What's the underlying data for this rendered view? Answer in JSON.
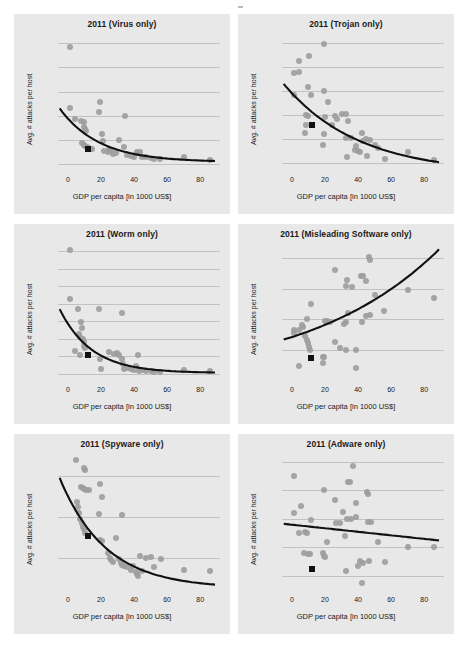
{
  "figure": {
    "title": "",
    "panel_background": "#e8e8e8",
    "point_color": "#9d9d9d",
    "highlight_color": "#111111",
    "curve_color": "#111111",
    "grid_color": "#c2c2c2"
  },
  "common": {
    "xlabel": "GDP per capita [in 1000 US$]",
    "ylabel": "Avg. # attacks per host",
    "xticks": [
      0,
      20,
      40,
      60,
      80
    ],
    "xlim": [
      -6,
      92
    ]
  },
  "chart_data": [
    {
      "type": "scatter",
      "title": "2011 (Virus only)",
      "xlabel": "GDP per capita [in 1000 US$]",
      "ylabel": "Avg. # attacks per host",
      "xlim": [
        -6,
        92
      ],
      "ylim": [
        -0.25,
        5.3
      ],
      "xticks": [
        0,
        20,
        40,
        60,
        80
      ],
      "yticks": [
        0,
        1,
        2,
        3,
        4,
        5
      ],
      "grid": true,
      "legend": "none",
      "points": [
        [
          1.5,
          4.85
        ],
        [
          1.0,
          2.3
        ],
        [
          4.5,
          1.85
        ],
        [
          8.0,
          1.8
        ],
        [
          9.5,
          1.75
        ],
        [
          10.0,
          1.55
        ],
        [
          10.5,
          1.45
        ],
        [
          11.0,
          1.35
        ],
        [
          8.5,
          0.85
        ],
        [
          9.5,
          0.8
        ],
        [
          10.5,
          0.75
        ],
        [
          11.5,
          0.72
        ],
        [
          12.5,
          0.68
        ],
        [
          13.5,
          0.62
        ],
        [
          14.5,
          0.6
        ],
        [
          19.5,
          2.55
        ],
        [
          19.0,
          2.15
        ],
        [
          20.5,
          1.25
        ],
        [
          21.0,
          0.95
        ],
        [
          22.0,
          0.55
        ],
        [
          24.0,
          0.5
        ],
        [
          25.0,
          0.62
        ],
        [
          26.0,
          0.58
        ],
        [
          27.0,
          0.42
        ],
        [
          29.0,
          0.45
        ],
        [
          31.0,
          0.98
        ],
        [
          34.5,
          2.0
        ],
        [
          34.0,
          0.72
        ],
        [
          36.0,
          0.38
        ],
        [
          38.0,
          0.35
        ],
        [
          40.0,
          0.3
        ],
        [
          42.0,
          0.48
        ],
        [
          43.5,
          0.5
        ],
        [
          45.0,
          0.28
        ],
        [
          47.0,
          0.3
        ],
        [
          50.0,
          0.25
        ],
        [
          52.0,
          0.22
        ],
        [
          56.0,
          0.2
        ],
        [
          70.5,
          0.3
        ],
        [
          86.0,
          0.18
        ]
      ],
      "highlight_point": [
        12.0,
        0.6
      ],
      "fit_type": "exponential_decay",
      "fit": {
        "y0": 2.3,
        "yinf": 0.08,
        "k": 0.042
      }
    },
    {
      "type": "scatter",
      "title": "2011 (Trojan only)",
      "xlabel": "GDP per capita [in 1000 US$]",
      "ylabel": "Avg. # attacks per host",
      "xlim": [
        -6,
        92
      ],
      "ylim": [
        0.7,
        6.3
      ],
      "xticks": [
        0,
        20,
        40,
        60,
        80
      ],
      "yticks": [
        1,
        2,
        3,
        4,
        5,
        6
      ],
      "grid": true,
      "legend": "none",
      "points": [
        [
          19.5,
          5.95
        ],
        [
          10.5,
          5.45
        ],
        [
          4.5,
          5.25
        ],
        [
          4.5,
          4.8
        ],
        [
          1.5,
          4.75
        ],
        [
          1.5,
          3.85
        ],
        [
          9.5,
          4.15
        ],
        [
          19.5,
          4.0
        ],
        [
          11.5,
          3.85
        ],
        [
          22.0,
          3.55
        ],
        [
          8.5,
          3.0
        ],
        [
          9.5,
          2.95
        ],
        [
          8.5,
          2.6
        ],
        [
          8.0,
          2.25
        ],
        [
          20.0,
          2.9
        ],
        [
          24.0,
          2.6
        ],
        [
          26.0,
          2.95
        ],
        [
          27.0,
          2.85
        ],
        [
          30.0,
          3.05
        ],
        [
          32.5,
          3.05
        ],
        [
          34.0,
          2.75
        ],
        [
          19.5,
          2.2
        ],
        [
          19.0,
          1.75
        ],
        [
          33.0,
          2.05
        ],
        [
          33.5,
          1.25
        ],
        [
          36.0,
          2.05
        ],
        [
          38.0,
          1.55
        ],
        [
          39.0,
          1.7
        ],
        [
          40.0,
          1.5
        ],
        [
          41.0,
          1.45
        ],
        [
          42.5,
          2.25
        ],
        [
          43.0,
          1.9
        ],
        [
          45.0,
          2.0
        ],
        [
          45.5,
          1.3
        ],
        [
          47.0,
          1.95
        ],
        [
          50.0,
          1.75
        ],
        [
          52.0,
          1.6
        ],
        [
          56.5,
          1.15
        ],
        [
          70.5,
          1.45
        ],
        [
          86.0,
          1.1
        ]
      ],
      "highlight_point": [
        12.0,
        2.6
      ],
      "fit_type": "exponential_decay",
      "fit": {
        "y0": 4.3,
        "yinf": 0.55,
        "k": 0.022
      }
    },
    {
      "type": "scatter",
      "title": "2011 (Worm only)",
      "xlabel": "GDP per capita [in 1000 US$]",
      "ylabel": "Avg. # attacks per host",
      "xlim": [
        -6,
        92
      ],
      "ylim": [
        -0.35,
        7.3
      ],
      "xticks": [
        0,
        20,
        40,
        60,
        80
      ],
      "yticks": [
        0,
        1,
        2,
        3,
        4,
        5,
        6,
        7
      ],
      "grid": true,
      "legend": "none",
      "points": [
        [
          1.5,
          7.05
        ],
        [
          1.0,
          4.25
        ],
        [
          6.0,
          3.7
        ],
        [
          19.0,
          3.7
        ],
        [
          33.0,
          3.45
        ],
        [
          8.0,
          2.95
        ],
        [
          8.5,
          2.6
        ],
        [
          7.0,
          2.3
        ],
        [
          7.5,
          2.1
        ],
        [
          9.0,
          2.0
        ],
        [
          9.5,
          1.8
        ],
        [
          10.0,
          1.6
        ],
        [
          10.5,
          1.45
        ],
        [
          4.0,
          1.3
        ],
        [
          7.5,
          1.1
        ],
        [
          19.5,
          0.85
        ],
        [
          20.0,
          0.3
        ],
        [
          25.0,
          1.25
        ],
        [
          28.0,
          1.15
        ],
        [
          29.5,
          1.2
        ],
        [
          31.0,
          1.05
        ],
        [
          32.5,
          0.85
        ],
        [
          33.5,
          0.55
        ],
        [
          34.0,
          0.3
        ],
        [
          36.0,
          0.35
        ],
        [
          38.0,
          0.25
        ],
        [
          40.0,
          0.2
        ],
        [
          41.0,
          0.45
        ],
        [
          42.5,
          1.05
        ],
        [
          43.0,
          0.15
        ],
        [
          45.0,
          0.2
        ],
        [
          47.0,
          0.15
        ],
        [
          50.0,
          0.18
        ],
        [
          52.0,
          0.12
        ],
        [
          56.0,
          0.12
        ],
        [
          70.5,
          0.2
        ],
        [
          86.0,
          0.15
        ]
      ],
      "highlight_point": [
        12.0,
        1.05
      ],
      "fit_type": "exponential_decay",
      "fit": {
        "y0": 3.7,
        "yinf": 0.05,
        "k": 0.052
      }
    },
    {
      "type": "scatter",
      "title": "2011 (Misleading Software only)",
      "xlabel": "GDP per capita [in 1000 US$]",
      "ylabel": "Avg. # attacks per host",
      "xlim": [
        -6,
        92
      ],
      "ylim": [
        0.0,
        0.088
      ],
      "xticks": [
        0,
        20,
        40,
        60,
        80
      ],
      "yticks": [
        0.02,
        0.04,
        0.06,
        0.08
      ],
      "ytick_labels": [
        "0.02",
        "0.04",
        "0.06",
        "0.08"
      ],
      "grid": true,
      "legend": "none",
      "points": [
        [
          46.5,
          0.081
        ],
        [
          47.0,
          0.079
        ],
        [
          26.0,
          0.072
        ],
        [
          33.5,
          0.066
        ],
        [
          42.0,
          0.068
        ],
        [
          43.0,
          0.068
        ],
        [
          45.0,
          0.065
        ],
        [
          33.0,
          0.062
        ],
        [
          36.5,
          0.061
        ],
        [
          70.0,
          0.059
        ],
        [
          86.0,
          0.054
        ],
        [
          50.5,
          0.056
        ],
        [
          11.5,
          0.05
        ],
        [
          9.0,
          0.04
        ],
        [
          34.0,
          0.044
        ],
        [
          45.0,
          0.042
        ],
        [
          47.5,
          0.043
        ],
        [
          56.0,
          0.045
        ],
        [
          20.0,
          0.039
        ],
        [
          21.5,
          0.039
        ],
        [
          23.0,
          0.038
        ],
        [
          31.5,
          0.037
        ],
        [
          33.0,
          0.038
        ],
        [
          42.5,
          0.038
        ],
        [
          6.0,
          0.036
        ],
        [
          7.0,
          0.035
        ],
        [
          4.5,
          0.033
        ],
        [
          1.5,
          0.033
        ],
        [
          1.0,
          0.031
        ],
        [
          8.0,
          0.029
        ],
        [
          9.0,
          0.026
        ],
        [
          10.0,
          0.024
        ],
        [
          10.5,
          0.022
        ],
        [
          11.0,
          0.02
        ],
        [
          26.0,
          0.025
        ],
        [
          29.0,
          0.021
        ],
        [
          33.0,
          0.02
        ],
        [
          39.0,
          0.02
        ],
        [
          18.5,
          0.015
        ],
        [
          19.5,
          0.015
        ],
        [
          19.0,
          0.011
        ],
        [
          4.5,
          0.009
        ],
        [
          38.5,
          0.008
        ]
      ],
      "highlight_point": [
        11.5,
        0.0145
      ],
      "fit_type": "exponential_growth",
      "fit": {
        "y0": 0.0265,
        "k": 0.0125
      }
    },
    {
      "type": "scatter",
      "title": "2011 (Spyware only)",
      "xlabel": "GDP per capita [in 1000 US$]",
      "ylabel": "Avg. # attacks per host",
      "xlim": [
        -6,
        92
      ],
      "ylim": [
        0.01,
        0.175
      ],
      "yticks": [
        0.05,
        0.1,
        0.15
      ],
      "ytick_labels": [
        "0.05",
        "0.10",
        "0.15"
      ],
      "xticks": [
        0,
        20,
        40,
        60,
        80
      ],
      "grid": true,
      "legend": "none",
      "points": [
        [
          5.0,
          0.17
        ],
        [
          9.5,
          0.16
        ],
        [
          10.5,
          0.158
        ],
        [
          8.0,
          0.137
        ],
        [
          9.0,
          0.136
        ],
        [
          10.0,
          0.134
        ],
        [
          11.0,
          0.133
        ],
        [
          12.5,
          0.133
        ],
        [
          19.5,
          0.14
        ],
        [
          20.5,
          0.125
        ],
        [
          5.5,
          0.118
        ],
        [
          6.0,
          0.112
        ],
        [
          6.5,
          0.105
        ],
        [
          19.0,
          0.103
        ],
        [
          33.0,
          0.102
        ],
        [
          7.5,
          0.098
        ],
        [
          8.5,
          0.092
        ],
        [
          9.0,
          0.088
        ],
        [
          9.5,
          0.085
        ],
        [
          10.5,
          0.08
        ],
        [
          19.5,
          0.072
        ],
        [
          20.5,
          0.07
        ],
        [
          29.0,
          0.074
        ],
        [
          24.5,
          0.055
        ],
        [
          25.5,
          0.05
        ],
        [
          26.0,
          0.047
        ],
        [
          27.0,
          0.044
        ],
        [
          31.0,
          0.048
        ],
        [
          32.0,
          0.043
        ],
        [
          33.0,
          0.041
        ],
        [
          34.0,
          0.04
        ],
        [
          36.0,
          0.038
        ],
        [
          38.0,
          0.035
        ],
        [
          39.5,
          0.04
        ],
        [
          41.0,
          0.032
        ],
        [
          42.0,
          0.03
        ],
        [
          42.5,
          0.027
        ],
        [
          43.5,
          0.052
        ],
        [
          45.0,
          0.033
        ],
        [
          47.0,
          0.05
        ],
        [
          50.5,
          0.051
        ],
        [
          52.0,
          0.038
        ],
        [
          56.5,
          0.048
        ],
        [
          70.5,
          0.035
        ],
        [
          86.0,
          0.033
        ]
      ],
      "highlight_point": [
        12.0,
        0.076
      ],
      "fit_type": "exponential_decay",
      "fit": {
        "y0": 0.148,
        "yinf": 0.012,
        "k": 0.036
      }
    },
    {
      "type": "scatter",
      "title": "2011 (Adware only)",
      "xlabel": "GDP per capita [in 1000 US$]",
      "ylabel": "Avg. # attacks per host",
      "xlim": [
        -6,
        92
      ],
      "ylim": [
        0.05,
        0.52
      ],
      "yticks": [
        0.1,
        0.2,
        0.3,
        0.4,
        0.5
      ],
      "ytick_labels": [
        "0.1",
        "0.2",
        "0.3",
        "0.4",
        "0.5"
      ],
      "xticks": [
        0,
        20,
        40,
        60,
        80
      ],
      "grid": true,
      "legend": "none",
      "points": [
        [
          37.0,
          0.485
        ],
        [
          1.5,
          0.45
        ],
        [
          34.0,
          0.43
        ],
        [
          35.0,
          0.428
        ],
        [
          19.5,
          0.4
        ],
        [
          45.5,
          0.395
        ],
        [
          46.0,
          0.385
        ],
        [
          26.0,
          0.365
        ],
        [
          39.0,
          0.355
        ],
        [
          5.5,
          0.345
        ],
        [
          1.0,
          0.32
        ],
        [
          31.0,
          0.325
        ],
        [
          39.0,
          0.305
        ],
        [
          33.5,
          0.3
        ],
        [
          36.0,
          0.3
        ],
        [
          46.0,
          0.29
        ],
        [
          48.0,
          0.29
        ],
        [
          11.5,
          0.295
        ],
        [
          26.5,
          0.285
        ],
        [
          29.0,
          0.285
        ],
        [
          4.5,
          0.25
        ],
        [
          8.0,
          0.255
        ],
        [
          9.0,
          0.25
        ],
        [
          32.0,
          0.24
        ],
        [
          21.0,
          0.22
        ],
        [
          52.0,
          0.22
        ],
        [
          70.0,
          0.2
        ],
        [
          86.0,
          0.2
        ],
        [
          7.5,
          0.18
        ],
        [
          9.5,
          0.175
        ],
        [
          11.0,
          0.175
        ],
        [
          19.0,
          0.18
        ],
        [
          19.5,
          0.17
        ],
        [
          20.0,
          0.165
        ],
        [
          41.0,
          0.15
        ],
        [
          43.0,
          0.145
        ],
        [
          46.5,
          0.15
        ],
        [
          56.5,
          0.148
        ],
        [
          40.0,
          0.135
        ],
        [
          33.0,
          0.118
        ],
        [
          42.5,
          0.075
        ]
      ],
      "highlight_point": [
        12.0,
        0.125
      ],
      "fit_type": "linear",
      "fit": {
        "intercept": 0.279,
        "slope": -0.00062
      }
    }
  ]
}
